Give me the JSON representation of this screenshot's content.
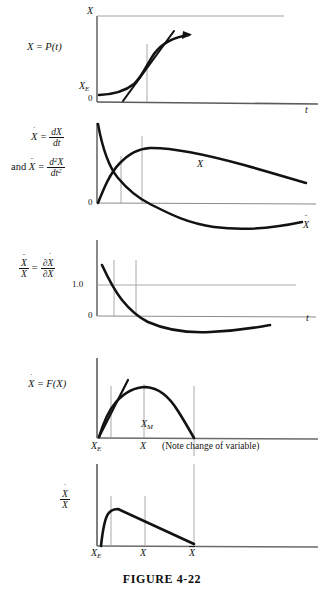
{
  "figure": {
    "caption": "FIGURE 4-22",
    "background_color": "#ffffff",
    "ink_color": "#141414",
    "axis_color": "#8a8a8a",
    "curve_color": "#121212"
  },
  "panels": [
    {
      "id": "panel-1",
      "equation_label": "X = P(t)",
      "equation_parts": {
        "lhs": "X",
        "rel": "=",
        "rhs_fn": "P",
        "rhs_arg": "t"
      },
      "y_axis_label": "X",
      "x_axis_label": "t",
      "y_ticks": [
        "X_E",
        "0"
      ],
      "y_tick_texts": [
        "X",
        "0"
      ],
      "y_tick_sub": [
        "E",
        ""
      ],
      "curves": [
        {
          "name": "sigmoid-growth-curve",
          "style": "thick"
        },
        {
          "name": "tangent-line",
          "style": "thick"
        }
      ],
      "markers": [
        "inflection-vertical-line"
      ]
    },
    {
      "id": "panel-2",
      "equation_line1": "X = dX/dt",
      "equation_line2": "and X = d2X/dt2",
      "and_word": "and",
      "num1": "dX",
      "den1": "dt",
      "num2": "d",
      "num2sup": "2",
      "num2var": "X",
      "den2": "dt",
      "den2sup": "2",
      "y_tick_texts": [
        "0"
      ],
      "curve_labels": [
        "X",
        "X"
      ],
      "curve_label_dots": [
        1,
        2
      ],
      "curves": [
        {
          "name": "first-derivative-curve",
          "style": "thick"
        },
        {
          "name": "second-derivative-curve",
          "style": "thick"
        }
      ],
      "markers": [
        "vertical-line-a",
        "vertical-line-b"
      ]
    },
    {
      "id": "panel-3",
      "equation_num": "X",
      "equation_num_dots": 2,
      "equation_den": "X",
      "equation_den_dots": 1,
      "equation_rhs_num": "∂X",
      "equation_rhs_num_dots": 1,
      "equation_rhs_den": "∂X",
      "equation_rhs_den_dots": 0,
      "y_ticks": [
        "1.0",
        "0"
      ],
      "x_axis_label": "t",
      "curves": [
        {
          "name": "relative-growth-rate-curve",
          "style": "thick"
        }
      ],
      "markers": [
        "vertical-line-a",
        "vertical-line-b",
        "horizontal-line-1.0"
      ]
    },
    {
      "id": "panel-4",
      "equation_label": "X = F(X)",
      "lhs": "X",
      "lhs_dots": 1,
      "rel": "=",
      "rhs_fn": "F",
      "rhs_arg": "X",
      "x_ticks": [
        "X_E",
        "X",
        "X_M"
      ],
      "peak_label": "X",
      "peak_label_sub": "M",
      "note": "(Note change of variable)",
      "curves": [
        {
          "name": "logistic-parabola-curve",
          "style": "thick"
        },
        {
          "name": "tangent-line",
          "style": "thick"
        }
      ],
      "markers": [
        "vertical-line-xe",
        "vertical-line-xm",
        "vertical-line-xbar"
      ]
    },
    {
      "id": "panel-5",
      "equation_num": "X",
      "equation_num_dots": 1,
      "equation_den": "X",
      "equation_den_dots": 0,
      "x_ticks": [
        "X_E",
        "X",
        "X̄"
      ],
      "x_tick_texts": [
        "X",
        "X",
        "X"
      ],
      "x_tick_sub": [
        "E",
        "",
        ""
      ],
      "x_tick_bar": [
        false,
        false,
        true
      ],
      "curves": [
        {
          "name": "specific-growth-rate-curve",
          "style": "thick"
        }
      ],
      "markers": [
        "vertical-line-xe",
        "vertical-line-x",
        "vertical-line-xbar"
      ]
    }
  ],
  "symbols": {
    "dot": "˙",
    "doubledot": "¨",
    "partial": "∂",
    "sub_E": "E",
    "sub_M": "M"
  }
}
